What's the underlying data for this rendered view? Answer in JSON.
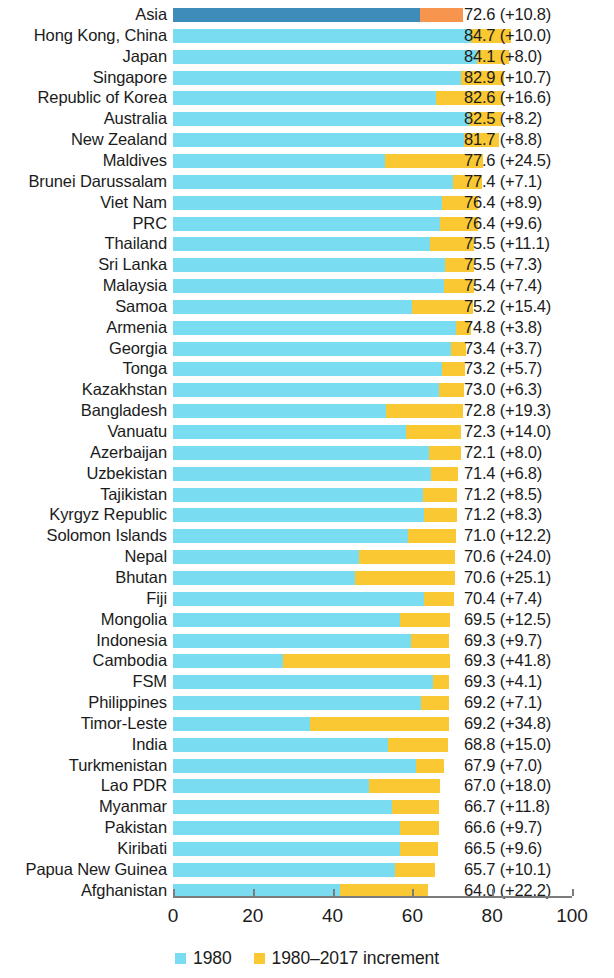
{
  "chart_data": {
    "type": "bar",
    "orientation": "horizontal",
    "stacked": true,
    "title": "",
    "subtitle": "",
    "xlabel": "",
    "ylabel": "",
    "xlim": [
      0,
      100
    ],
    "xticks": [
      0,
      20,
      40,
      60,
      80,
      100
    ],
    "xtick_labels": [
      "0",
      "20",
      "40",
      "60",
      "80",
      "100"
    ],
    "grid": false,
    "legend_position": "bottom-center",
    "legend": [
      {
        "label": "1980",
        "color": "#79dcf0",
        "swatch": "legend-swatch-1980"
      },
      {
        "label": "1980–2017 increment",
        "color": "#f9c833",
        "swatch": "legend-swatch-increment"
      }
    ],
    "series": [
      {
        "name": "1980",
        "color": "#79dcf0",
        "highlight_color": "#3d8cba"
      },
      {
        "name": "1980–2017 increment",
        "color": "#f9c833",
        "highlight_color": "#f7944d"
      }
    ],
    "value_label_format": "{total} (+{increment})",
    "categories": [
      "Asia",
      "Hong Kong, China",
      "Japan",
      "Singapore",
      "Republic of Korea",
      "Australia",
      "New Zealand",
      "Maldives",
      "Brunei Darussalam",
      "Viet Nam",
      "PRC",
      "Thailand",
      "Sri Lanka",
      "Malaysia",
      "Samoa",
      "Armenia",
      "Georgia",
      "Tonga",
      "Kazakhstan",
      "Bangladesh",
      "Vanuatu",
      "Azerbaijan",
      "Uzbekistan",
      "Tajikistan",
      "Kyrgyz Republic",
      "Solomon Islands",
      "Nepal",
      "Bhutan",
      "Fiji",
      "Mongolia",
      "Indonesia",
      "Cambodia",
      "FSM",
      "Philippines",
      "Timor-Leste",
      "India",
      "Turkmenistan",
      "Lao PDR",
      "Myanmar",
      "Pakistan",
      "Kiribati",
      "Papua New Guinea",
      "Afghanistan"
    ],
    "rows": [
      {
        "label": "Asia",
        "base": 61.8,
        "increment": 10.8,
        "total": 72.6,
        "value_label": "72.6 (+10.8)",
        "highlight": true
      },
      {
        "label": "Hong Kong, China",
        "base": 74.7,
        "increment": 10.0,
        "total": 84.7,
        "value_label": "84.7 (+10.0)",
        "highlight": false
      },
      {
        "label": "Japan",
        "base": 76.1,
        "increment": 8.0,
        "total": 84.1,
        "value_label": "84.1 (+8.0)",
        "highlight": false
      },
      {
        "label": "Singapore",
        "base": 72.2,
        "increment": 10.7,
        "total": 82.9,
        "value_label": "82.9 (+10.7)",
        "highlight": false
      },
      {
        "label": "Republic of Korea",
        "base": 66.0,
        "increment": 16.6,
        "total": 82.6,
        "value_label": "82.6 (+16.6)",
        "highlight": false
      },
      {
        "label": "Australia",
        "base": 74.3,
        "increment": 8.2,
        "total": 82.5,
        "value_label": "82.5 (+8.2)",
        "highlight": false
      },
      {
        "label": "New Zealand",
        "base": 72.9,
        "increment": 8.8,
        "total": 81.7,
        "value_label": "81.7 (+8.8)",
        "highlight": false
      },
      {
        "label": "Maldives",
        "base": 53.1,
        "increment": 24.5,
        "total": 77.6,
        "value_label": "77.6 (+24.5)",
        "highlight": false
      },
      {
        "label": "Brunei Darussalam",
        "base": 70.3,
        "increment": 7.1,
        "total": 77.4,
        "value_label": "77.4 (+7.1)",
        "highlight": false
      },
      {
        "label": "Viet Nam",
        "base": 67.5,
        "increment": 8.9,
        "total": 76.4,
        "value_label": "76.4 (+8.9)",
        "highlight": false
      },
      {
        "label": "PRC",
        "base": 66.8,
        "increment": 9.6,
        "total": 76.4,
        "value_label": "76.4 (+9.6)",
        "highlight": false
      },
      {
        "label": "Thailand",
        "base": 64.4,
        "increment": 11.1,
        "total": 75.5,
        "value_label": "75.5 (+11.1)",
        "highlight": false
      },
      {
        "label": "Sri Lanka",
        "base": 68.2,
        "increment": 7.3,
        "total": 75.5,
        "value_label": "75.5 (+7.3)",
        "highlight": false
      },
      {
        "label": "Malaysia",
        "base": 68.0,
        "increment": 7.4,
        "total": 75.4,
        "value_label": "75.4 (+7.4)",
        "highlight": false
      },
      {
        "label": "Samoa",
        "base": 59.8,
        "increment": 15.4,
        "total": 75.2,
        "value_label": "75.2 (+15.4)",
        "highlight": false
      },
      {
        "label": "Armenia",
        "base": 71.0,
        "increment": 3.8,
        "total": 74.8,
        "value_label": "74.8 (+3.8)",
        "highlight": false
      },
      {
        "label": "Georgia",
        "base": 69.7,
        "increment": 3.7,
        "total": 73.4,
        "value_label": "73.4 (+3.7)",
        "highlight": false
      },
      {
        "label": "Tonga",
        "base": 67.5,
        "increment": 5.7,
        "total": 73.2,
        "value_label": "73.2 (+5.7)",
        "highlight": false
      },
      {
        "label": "Kazakhstan",
        "base": 66.7,
        "increment": 6.3,
        "total": 73.0,
        "value_label": "73.0 (+6.3)",
        "highlight": false
      },
      {
        "label": "Bangladesh",
        "base": 53.5,
        "increment": 19.3,
        "total": 72.8,
        "value_label": "72.8 (+19.3)",
        "highlight": false
      },
      {
        "label": "Vanuatu",
        "base": 58.3,
        "increment": 14.0,
        "total": 72.3,
        "value_label": "72.3 (+14.0)",
        "highlight": false
      },
      {
        "label": "Azerbaijan",
        "base": 64.1,
        "increment": 8.0,
        "total": 72.1,
        "value_label": "72.1 (+8.0)",
        "highlight": false
      },
      {
        "label": "Uzbekistan",
        "base": 64.6,
        "increment": 6.8,
        "total": 71.4,
        "value_label": "71.4 (+6.8)",
        "highlight": false
      },
      {
        "label": "Tajikistan",
        "base": 62.7,
        "increment": 8.5,
        "total": 71.2,
        "value_label": "71.2 (+8.5)",
        "highlight": false
      },
      {
        "label": "Kyrgyz Republic",
        "base": 62.9,
        "increment": 8.3,
        "total": 71.2,
        "value_label": "71.2 (+8.3)",
        "highlight": false
      },
      {
        "label": "Solomon Islands",
        "base": 58.8,
        "increment": 12.2,
        "total": 71.0,
        "value_label": "71.0 (+12.2)",
        "highlight": false
      },
      {
        "label": "Nepal",
        "base": 46.6,
        "increment": 24.0,
        "total": 70.6,
        "value_label": "70.6 (+24.0)",
        "highlight": false
      },
      {
        "label": "Bhutan",
        "base": 45.5,
        "increment": 25.1,
        "total": 70.6,
        "value_label": "70.6 (+25.1)",
        "highlight": false
      },
      {
        "label": "Fiji",
        "base": 63.0,
        "increment": 7.4,
        "total": 70.4,
        "value_label": "70.4 (+7.4)",
        "highlight": false
      },
      {
        "label": "Mongolia",
        "base": 57.0,
        "increment": 12.5,
        "total": 69.5,
        "value_label": "69.5 (+12.5)",
        "highlight": false
      },
      {
        "label": "Indonesia",
        "base": 59.6,
        "increment": 9.7,
        "total": 69.3,
        "value_label": "69.3 (+9.7)",
        "highlight": false
      },
      {
        "label": "Cambodia",
        "base": 27.5,
        "increment": 41.8,
        "total": 69.3,
        "value_label": "69.3 (+41.8)",
        "highlight": false
      },
      {
        "label": "FSM",
        "base": 65.2,
        "increment": 4.1,
        "total": 69.3,
        "value_label": "69.3 (+4.1)",
        "highlight": false
      },
      {
        "label": "Philippines",
        "base": 62.1,
        "increment": 7.1,
        "total": 69.2,
        "value_label": "69.2 (+7.1)",
        "highlight": false
      },
      {
        "label": "Timor-Leste",
        "base": 34.4,
        "increment": 34.8,
        "total": 69.2,
        "value_label": "69.2 (+34.8)",
        "highlight": false
      },
      {
        "label": "India",
        "base": 53.8,
        "increment": 15.0,
        "total": 68.8,
        "value_label": "68.8 (+15.0)",
        "highlight": false
      },
      {
        "label": "Turkmenistan",
        "base": 60.9,
        "increment": 7.0,
        "total": 67.9,
        "value_label": "67.9 (+7.0)",
        "highlight": false
      },
      {
        "label": "Lao PDR",
        "base": 49.0,
        "increment": 18.0,
        "total": 67.0,
        "value_label": "67.0 (+18.0)",
        "highlight": false
      },
      {
        "label": "Myanmar",
        "base": 54.9,
        "increment": 11.8,
        "total": 66.7,
        "value_label": "66.7 (+11.8)",
        "highlight": false
      },
      {
        "label": "Pakistan",
        "base": 56.9,
        "increment": 9.7,
        "total": 66.6,
        "value_label": "66.6 (+9.7)",
        "highlight": false
      },
      {
        "label": "Kiribati",
        "base": 56.9,
        "increment": 9.6,
        "total": 66.5,
        "value_label": "66.5 (+9.6)",
        "highlight": false
      },
      {
        "label": "Papua New Guinea",
        "base": 55.6,
        "increment": 10.1,
        "total": 65.7,
        "value_label": "65.7 (+10.1)",
        "highlight": false
      },
      {
        "label": "Afghanistan",
        "base": 41.8,
        "increment": 22.2,
        "total": 64.0,
        "value_label": "64.0 (+22.2)",
        "highlight": false
      }
    ]
  }
}
